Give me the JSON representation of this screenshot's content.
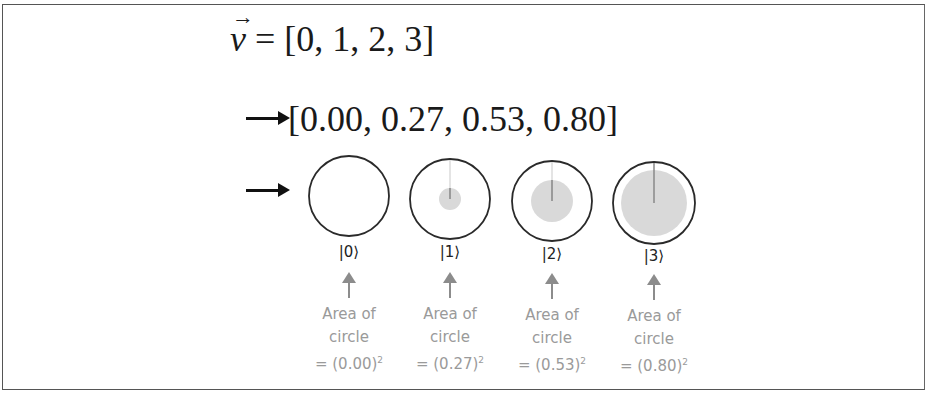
{
  "equation_vector": {
    "symbol": "v",
    "arrow": "→",
    "rhs": "= [0, 1, 2, 3]"
  },
  "equation_normalized": {
    "text": "[0.00, 0.27, 0.53, 0.80]"
  },
  "states": [
    {
      "ket": "|0⟩",
      "amplitude": 0.0,
      "caption_line1": "Area of",
      "caption_line2": "circle",
      "caption_line3": "= (0.00)",
      "exponent": "2"
    },
    {
      "ket": "|1⟩",
      "amplitude": 0.27,
      "caption_line1": "Area of",
      "caption_line2": "circle",
      "caption_line3": "= (0.27)",
      "exponent": "2"
    },
    {
      "ket": "|2⟩",
      "amplitude": 0.53,
      "caption_line1": "Area of",
      "caption_line2": "circle",
      "caption_line3": "= (0.53)",
      "exponent": "2"
    },
    {
      "ket": "|3⟩",
      "amplitude": 0.8,
      "caption_line1": "Area of",
      "caption_line2": "circle",
      "caption_line3": "= (0.80)",
      "exponent": "2"
    }
  ],
  "colors": {
    "outline": "#2a2a2a",
    "fill": "#d9d9d9",
    "caption": "#9a9a9a",
    "pointer_arrow": "#8c8c8c"
  }
}
